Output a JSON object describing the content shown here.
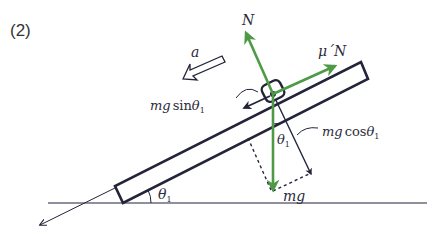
{
  "figure": {
    "part_label": "(2)",
    "colors": {
      "ink": "#23233a",
      "force_green": "#4e9a46",
      "background": "#ffffff"
    }
  },
  "labels": {
    "normal_force": "N",
    "friction_force_mu": "μ´",
    "friction_force_N": "N",
    "acceleration": "a",
    "sin_component_mg": "mg",
    "sin_component_fn": "sin",
    "sin_component_theta": "θ",
    "sin_component_sub": "1",
    "cos_component_mg": "mg",
    "cos_component_fn": "cos",
    "cos_component_theta": "θ",
    "cos_component_sub": "1",
    "gravity": "mg",
    "angle_at_block": "θ",
    "angle_at_block_sub": "1",
    "angle_incline": "θ",
    "angle_incline_sub": "1"
  }
}
